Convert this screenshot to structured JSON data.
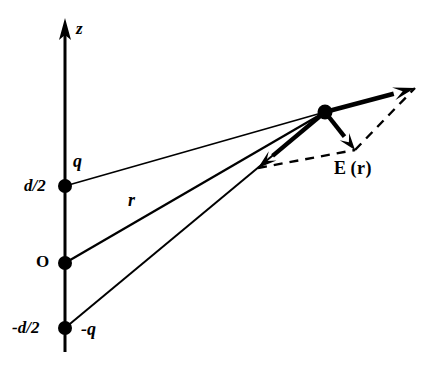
{
  "figure": {
    "axis": {
      "name": "z-axis",
      "label": "z",
      "arrow_tip": [
        65,
        22
      ],
      "bottom": [
        65,
        352
      ]
    },
    "points": [
      {
        "name": "positive-charge",
        "label": "q",
        "axis_label": "d/2",
        "x": 65,
        "y": 186
      },
      {
        "name": "origin",
        "label": "O",
        "axis_label": "O",
        "x": 65,
        "y": 263
      },
      {
        "name": "negative-charge",
        "label": "-q",
        "axis_label": "-d/2",
        "x": 65,
        "y": 328
      }
    ],
    "field_point": {
      "name": "field-point",
      "x": 325,
      "y": 112
    },
    "distance_label": "r",
    "field_label_E": "E",
    "field_label_r": "(r)",
    "vectors": {
      "resultant": {
        "from": [
          325,
          112
        ],
        "to": [
          415,
          88
        ]
      },
      "component_from_positive": {
        "from": [
          325,
          112
        ],
        "to": [
          355,
          150
        ]
      },
      "component_from_negative": {
        "from": [
          325,
          112
        ],
        "to": [
          258,
          168
        ]
      }
    },
    "dashed_construction": [
      {
        "from": [
          258,
          168
        ],
        "to": [
          355,
          150
        ]
      },
      {
        "from": [
          355,
          150
        ],
        "to": [
          415,
          88
        ]
      }
    ],
    "rays": [
      {
        "from": [
          65,
          186
        ],
        "to": [
          325,
          112
        ]
      },
      {
        "from": [
          65,
          263
        ],
        "to": [
          325,
          112
        ]
      },
      {
        "from": [
          65,
          328
        ],
        "to": [
          325,
          112
        ]
      }
    ],
    "colors": {
      "ink": "#000000",
      "background": "#ffffff"
    }
  }
}
